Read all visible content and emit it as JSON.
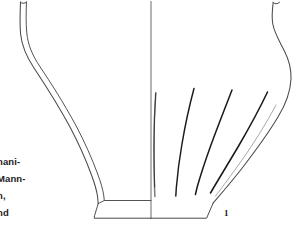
{
  "figure": {
    "kind": "archaeological-vessel-line-drawing",
    "number_label": "1",
    "background_color": "#ffffff",
    "ink_color": "#1a1a1a",
    "outline_color": "#4a4a4a",
    "convention": "left half = cross-section profile, right half = exterior elevation"
  },
  "caption": {
    "lines": [
      "nani-",
      "Mann-",
      "n,",
      "nd"
    ]
  },
  "vessel": {
    "parts": [
      {
        "name": "rim",
        "note": "everted rim, cut off at top edge of image"
      },
      {
        "name": "neck",
        "note": "short concave neck"
      },
      {
        "name": "shoulder",
        "note": "rounded carinated shoulder, maximum diameter"
      },
      {
        "name": "body",
        "note": "tapering conical lower body"
      },
      {
        "name": "foot",
        "note": "slightly splayed flat base with low pedestal"
      }
    ],
    "section_line": {
      "name": "center-axis",
      "x": 151
    },
    "decoration": {
      "type": "incised-curved-grooves",
      "count": 4,
      "note": "fanning grooves on right exterior half, from shoulder to base"
    }
  }
}
